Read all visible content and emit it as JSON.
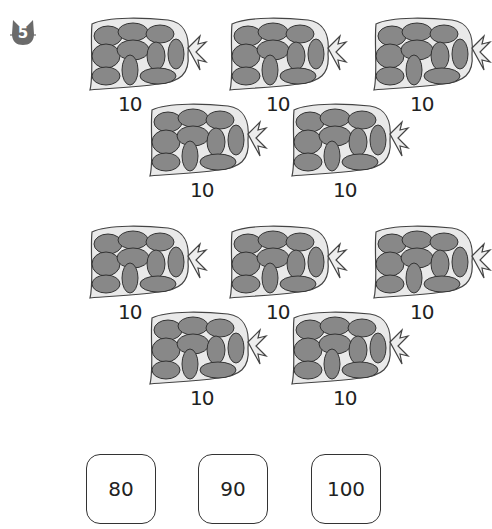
{
  "problem": {
    "number": "5",
    "icon": "cat-badge-icon"
  },
  "group1": {
    "bags": [
      {
        "label": "10",
        "x": 88,
        "y": 14,
        "lx": 118,
        "ly": 92
      },
      {
        "label": "10",
        "x": 228,
        "y": 14,
        "lx": 266,
        "ly": 92
      },
      {
        "label": "10",
        "x": 372,
        "y": 14,
        "lx": 410,
        "ly": 92
      },
      {
        "label": "10",
        "x": 148,
        "y": 100,
        "lx": 190,
        "ly": 178
      },
      {
        "label": "10",
        "x": 290,
        "y": 100,
        "lx": 333,
        "ly": 178
      }
    ]
  },
  "group2": {
    "bags": [
      {
        "label": "10",
        "x": 88,
        "y": 222,
        "lx": 118,
        "ly": 300
      },
      {
        "label": "10",
        "x": 228,
        "y": 222,
        "lx": 266,
        "ly": 300
      },
      {
        "label": "10",
        "x": 372,
        "y": 222,
        "lx": 410,
        "ly": 300
      },
      {
        "label": "10",
        "x": 148,
        "y": 308,
        "lx": 190,
        "ly": 386
      },
      {
        "label": "10",
        "x": 290,
        "y": 308,
        "lx": 333,
        "ly": 386
      }
    ]
  },
  "choices": [
    {
      "label": "80",
      "x": 86
    },
    {
      "label": "90",
      "x": 198
    },
    {
      "label": "100",
      "x": 311
    }
  ]
}
